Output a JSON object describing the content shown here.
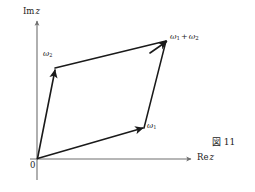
{
  "figure": {
    "caption": "図 11",
    "background_color": "#ffffff",
    "ink_color": "#1a1a1a",
    "axis_color": "#6e6e6e",
    "type": "complex-plane-period-lattice-parallelogram"
  },
  "axes": {
    "imaginary": {
      "label_prefix": "Im",
      "label_var": "z",
      "label_full": "Im z",
      "orientation": "vertical",
      "arrow": "up"
    },
    "real": {
      "label_prefix": "Re",
      "label_var": "z",
      "label_full": "Re z",
      "orientation": "horizontal",
      "arrow": "right"
    },
    "origin_label": "0"
  },
  "vectors": [
    {
      "name": "omega-1",
      "label_base": "ω",
      "label_sub": "1",
      "label_full": "ω1",
      "from": "origin",
      "to": "omega-1-tip",
      "arrow": true
    },
    {
      "name": "omega-2",
      "label_base": "ω",
      "label_sub": "2",
      "label_full": "ω2",
      "from": "origin",
      "to": "omega-2-tip",
      "arrow": true
    },
    {
      "name": "omega-sum",
      "label_base_1": "ω",
      "label_sub_1": "1",
      "label_operator": "+",
      "label_base_2": "ω",
      "label_sub_2": "2",
      "label_full": "ω1 + ω2",
      "from": "omega-2-tip",
      "to": "omega-sum-tip",
      "arrow": true
    }
  ],
  "geometry": {
    "origin": {
      "x": 37,
      "y": 159
    },
    "omega_1_tip": {
      "x": 143,
      "y": 127
    },
    "omega_2_tip": {
      "x": 55,
      "y": 68
    },
    "omega_sum_tip": {
      "x": 166,
      "y": 41
    },
    "im_axis_top": {
      "x": 37,
      "y": 20
    },
    "im_axis_bottom": {
      "x": 37,
      "y": 180
    },
    "re_axis_right": {
      "x": 192,
      "y": 159
    }
  }
}
